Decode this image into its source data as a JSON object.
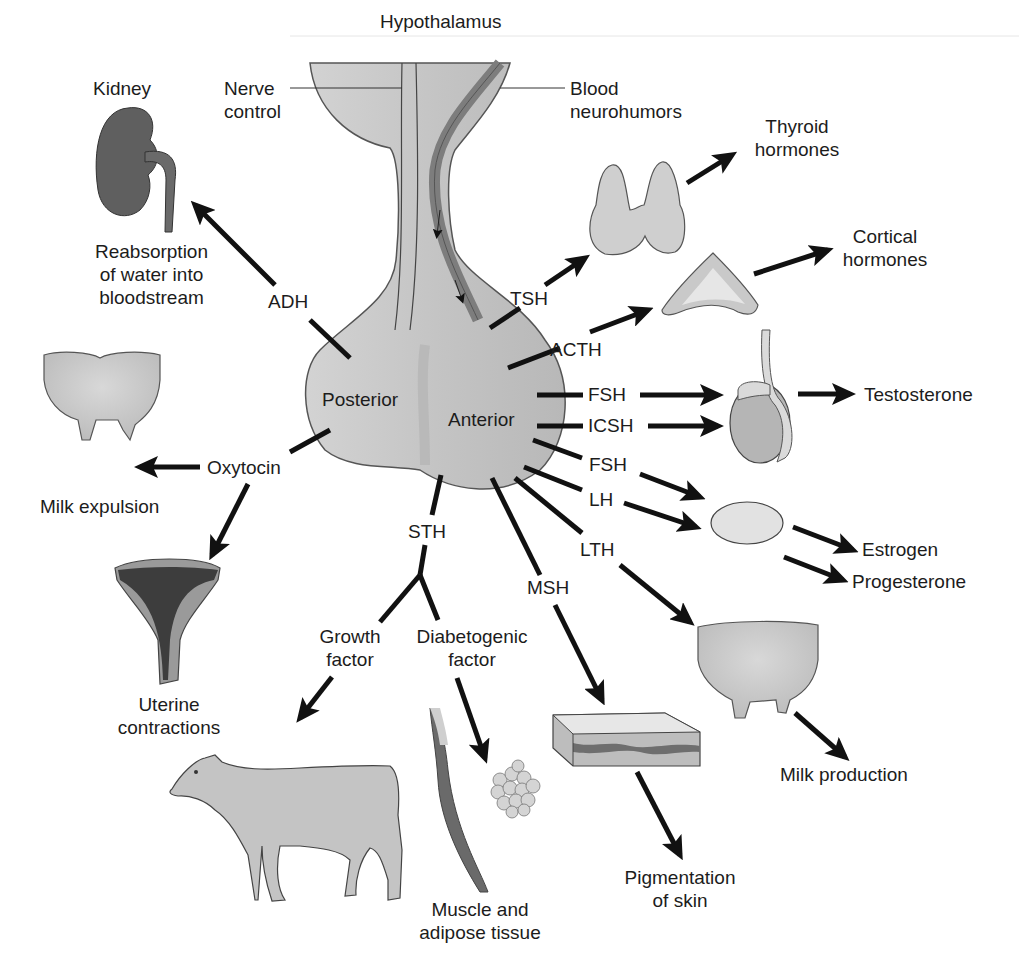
{
  "title": "Hypothalamus",
  "hypothalamus": {
    "nerve_control": "Nerve\ncontrol",
    "blood_neurohumors": "Blood\nneurohumors"
  },
  "pituitary": {
    "posterior": "Posterior",
    "anterior": "Anterior"
  },
  "posterior_hormones": [
    {
      "hormone": "ADH",
      "target": "Kidney",
      "effect": "Reabsorption\nof water into\nbloodstream"
    },
    {
      "hormone": "Oxytocin",
      "target": "Udder",
      "effect": "Milk expulsion"
    },
    {
      "hormone": "Oxytocin",
      "target": "Uterus",
      "effect": "Uterine\ncontractions"
    }
  ],
  "anterior_hormones": [
    {
      "hormone": "TSH",
      "target": "Thyroid",
      "product": "Thyroid\nhormones"
    },
    {
      "hormone": "ACTH",
      "target": "Adrenal cortex",
      "product": "Cortical\nhormones"
    },
    {
      "hormone": "FSH",
      "target": "Testis",
      "product": "Testosterone"
    },
    {
      "hormone": "ICSH",
      "target": "Testis",
      "product": "Testosterone"
    },
    {
      "hormone": "FSH",
      "target": "Ovary",
      "product": "Estrogen"
    },
    {
      "hormone": "LH",
      "target": "Ovary",
      "product": "Progesterone"
    },
    {
      "hormone": "LTH",
      "target": "Udder",
      "product": "Milk production"
    },
    {
      "hormone": "MSH",
      "target": "Skin",
      "product": "Pigmentation\nof skin"
    },
    {
      "hormone": "STH",
      "branches": [
        {
          "name": "Growth\nfactor",
          "target": "Cow"
        },
        {
          "name": "Diabetogenic\nfactor",
          "target": "Muscle and adipose tissue",
          "effect": "Muscle and\nadipose tissue"
        }
      ]
    }
  ],
  "labels": {
    "kidney": "Kidney",
    "adh": "ADH",
    "reabsorption": "Reabsorption\nof water into\nbloodstream",
    "oxytocin": "Oxytocin",
    "milk_expulsion": "Milk expulsion",
    "uterine": "Uterine\ncontractions",
    "tsh": "TSH",
    "thyroid_hormones": "Thyroid\nhormones",
    "acth": "ACTH",
    "cortical_hormones": "Cortical\nhormones",
    "fsh1": "FSH",
    "icsh": "ICSH",
    "testosterone": "Testosterone",
    "fsh2": "FSH",
    "lh": "LH",
    "estrogen": "Estrogen",
    "progesterone": "Progesterone",
    "lth": "LTH",
    "milk_production": "Milk production",
    "msh": "MSH",
    "pigmentation": "Pigmentation\nof skin",
    "sth": "STH",
    "growth_factor": "Growth\nfactor",
    "diabetogenic_factor": "Diabetogenic\nfactor",
    "muscle_adipose": "Muscle and\nadipose tissue"
  },
  "colors": {
    "gland_fill": "#c9c9c9",
    "gland_stroke": "#555555",
    "blood_vessel": "#8a8a8a",
    "arrow": "#111111",
    "kidney": "#5a5a5a"
  }
}
